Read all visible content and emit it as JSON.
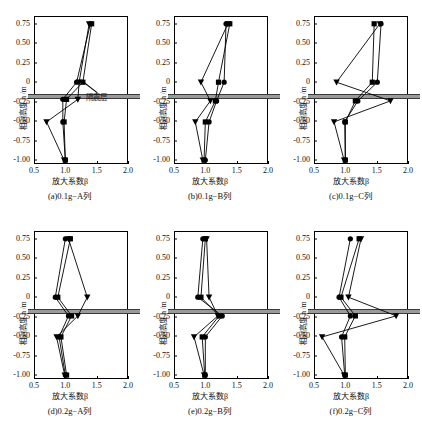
{
  "figure": {
    "axis": {
      "xlabel": "放大系数β",
      "ylabel": "相对高度  h /m",
      "xticks": [
        "0.5",
        "1.0",
        "1.5",
        "2.0"
      ],
      "xtick_values": [
        0.5,
        1.0,
        1.5,
        2.0
      ],
      "yticks": [
        "0.75",
        "0.50",
        "0.25",
        "0",
        "-0.25",
        "-0.50",
        "-0.75",
        "-1.00"
      ],
      "ytick_values": [
        0.75,
        0.5,
        0.25,
        0,
        -0.25,
        -0.5,
        -0.75,
        -1.0
      ],
      "xlim": [
        0.5,
        2.0
      ],
      "ylim": [
        -1.05,
        0.85
      ]
    },
    "annotation": {
      "label": "隔震层",
      "band_center": -0.185,
      "band_half_height": 0.035,
      "band_color": "#9a9a9a"
    },
    "panels": [
      {
        "id": "a",
        "caption": "(a)0.1g−A列",
        "has_annotation": true,
        "band_overhang": true
      },
      {
        "id": "b",
        "caption": "(b)0.1g−B列",
        "has_annotation": false,
        "band_overhang": true
      },
      {
        "id": "c",
        "caption": "(c)0.1g−C列",
        "has_annotation": false,
        "band_overhang": true
      },
      {
        "id": "d",
        "caption": "(d)0.2g−A列",
        "has_annotation": false,
        "band_overhang": true
      },
      {
        "id": "e",
        "caption": "(e)0.2g−B列",
        "has_annotation": false,
        "band_overhang": true
      },
      {
        "id": "f",
        "caption": "(f)0.2g−C列",
        "has_annotation": false,
        "band_overhang": true
      }
    ]
  },
  "chart_data": [
    {
      "type": "line",
      "id": "a",
      "title": "(a)0.1g−A列",
      "xlabel": "放大系数β",
      "ylabel": "相对高度  h /m",
      "xlim": [
        0.5,
        2.0
      ],
      "ylim": [
        -1.05,
        0.85
      ],
      "grid": false,
      "legend": "none",
      "y": [
        0.75,
        0,
        -0.22,
        -0.51,
        -1.0
      ],
      "series": [
        {
          "name": "series-1",
          "marker": "square",
          "values": [
            1.42,
            1.28,
            1.02,
            0.98,
            1.0
          ]
        },
        {
          "name": "series-2",
          "marker": "circle",
          "values": [
            1.4,
            1.18,
            0.96,
            0.96,
            1.0
          ]
        },
        {
          "name": "series-3",
          "marker": "triangle",
          "values": [
            1.38,
            1.22,
            1.2,
            0.7,
            0.98
          ]
        }
      ]
    },
    {
      "type": "line",
      "id": "b",
      "title": "(b)0.1g−B列",
      "xlabel": "放大系数β",
      "ylabel": "相对高度  h /m",
      "xlim": [
        0.5,
        2.0
      ],
      "ylim": [
        -1.05,
        0.85
      ],
      "grid": false,
      "legend": "none",
      "y": [
        0.75,
        0,
        -0.24,
        -0.51,
        -1.0
      ],
      "series": [
        {
          "name": "series-1",
          "marker": "square",
          "values": [
            1.39,
            1.21,
            1.16,
            1.0,
            0.98
          ]
        },
        {
          "name": "series-2",
          "marker": "circle",
          "values": [
            1.33,
            1.3,
            1.18,
            1.06,
            1.0
          ]
        },
        {
          "name": "series-3",
          "marker": "triangle",
          "values": [
            1.36,
            0.93,
            1.08,
            0.84,
            0.96
          ]
        }
      ]
    },
    {
      "type": "line",
      "id": "c",
      "title": "(c)0.1g−C列",
      "xlabel": "放大系数β",
      "ylabel": "相对高度  h /m",
      "xlim": [
        0.5,
        2.0
      ],
      "ylim": [
        -1.05,
        0.85
      ],
      "grid": false,
      "legend": "none",
      "y": [
        0.75,
        0,
        -0.24,
        -0.51,
        -1.0
      ],
      "series": [
        {
          "name": "series-1",
          "marker": "square",
          "values": [
            1.46,
            1.43,
            1.16,
            1.0,
            1.0
          ]
        },
        {
          "name": "series-2",
          "marker": "circle",
          "values": [
            1.57,
            1.51,
            1.2,
            0.99,
            1.0
          ]
        },
        {
          "name": "series-3",
          "marker": "triangle",
          "values": [
            1.55,
            0.86,
            1.72,
            0.82,
            0.98
          ]
        }
      ]
    },
    {
      "type": "line",
      "id": "d",
      "title": "(d)0.2g−A列",
      "xlabel": "放大系数β",
      "ylabel": "相对高度  h /m",
      "xlim": [
        0.5,
        2.0
      ],
      "ylim": [
        -1.05,
        0.85
      ],
      "grid": false,
      "legend": "none",
      "y": [
        0.75,
        0,
        -0.24,
        -0.51,
        -1.0
      ],
      "series": [
        {
          "name": "series-1",
          "marker": "square",
          "values": [
            1.08,
            0.88,
            1.1,
            0.93,
            1.02
          ]
        },
        {
          "name": "series-2",
          "marker": "circle",
          "values": [
            1.0,
            0.84,
            1.05,
            0.9,
            1.0
          ]
        },
        {
          "name": "series-3",
          "marker": "triangle",
          "values": [
            1.05,
            1.35,
            1.2,
            0.86,
            0.99
          ]
        }
      ]
    },
    {
      "type": "line",
      "id": "e",
      "title": "(e)0.2g−B列",
      "xlabel": "放大系数β",
      "ylabel": "相对高度  h /m",
      "xlim": [
        0.5,
        2.0
      ],
      "ylim": [
        -1.05,
        0.85
      ],
      "grid": false,
      "legend": "none",
      "y": [
        0.75,
        0,
        -0.24,
        -0.51,
        -1.0
      ],
      "series": [
        {
          "name": "series-1",
          "marker": "square",
          "values": [
            1.0,
            0.93,
            1.22,
            0.95,
            0.99
          ]
        },
        {
          "name": "series-2",
          "marker": "circle",
          "values": [
            0.96,
            0.88,
            1.27,
            1.0,
            1.0
          ]
        },
        {
          "name": "series-3",
          "marker": "triangle",
          "values": [
            1.02,
            1.06,
            1.2,
            0.82,
            0.98
          ]
        }
      ]
    },
    {
      "type": "line",
      "id": "f",
      "title": "(f)0.2g−C列",
      "xlabel": "放大系数β",
      "ylabel": "相对高度  h /m",
      "xlim": [
        0.5,
        2.0
      ],
      "ylim": [
        -1.05,
        0.85
      ],
      "grid": false,
      "legend": "none",
      "y": [
        0.75,
        0,
        -0.24,
        -0.51,
        -1.0
      ],
      "series": [
        {
          "name": "series-1",
          "marker": "square",
          "values": [
            1.22,
            0.93,
            1.16,
            0.99,
            1.0
          ]
        },
        {
          "name": "series-2",
          "marker": "circle",
          "values": [
            1.08,
            0.9,
            1.08,
            0.94,
            0.99
          ]
        },
        {
          "name": "series-3",
          "marker": "triangle",
          "values": [
            1.25,
            1.05,
            1.81,
            0.63,
            0.98
          ]
        }
      ]
    }
  ]
}
